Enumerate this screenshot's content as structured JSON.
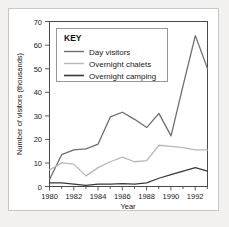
{
  "chart_data": {
    "type": "line",
    "title": "",
    "xlabel": "Year",
    "ylabel": "Number of visitors (thousands)",
    "x": [
      1980,
      1981,
      1982,
      1983,
      1984,
      1985,
      1986,
      1987,
      1988,
      1989,
      1990,
      1991,
      1992,
      1993
    ],
    "xlim": [
      1980,
      1993
    ],
    "ylim": [
      0,
      70
    ],
    "yticks": [
      0,
      10,
      20,
      30,
      40,
      50,
      60,
      70
    ],
    "xticks": [
      1980,
      1982,
      1984,
      1986,
      1988,
      1990,
      1992
    ],
    "xtick_labels": [
      "1980",
      "1982",
      "1984",
      "1986",
      "1988",
      "1990",
      "1992"
    ],
    "ytick_labels": [
      "0",
      "10",
      "20",
      "30",
      "40",
      "50",
      "60",
      "70"
    ],
    "grid": false,
    "legend_position": "top-left",
    "legend_title": "KEY",
    "series": [
      {
        "name": "Day visitors",
        "color": "#6e6e6e",
        "values": [
          3,
          13.5,
          15.5,
          16,
          18,
          29.5,
          31.5,
          28.5,
          25,
          31,
          21.5,
          43,
          64,
          50
        ]
      },
      {
        "name": "Overnight chalets",
        "color": "#b8b8b8",
        "values": [
          7,
          10,
          9.5,
          4.5,
          8,
          10.5,
          12.5,
          10.5,
          11,
          17.5,
          17,
          16.5,
          15.5,
          15.5
        ]
      },
      {
        "name": "Overnight camping",
        "color": "#3a3a3a",
        "values": [
          1.5,
          1.5,
          1,
          0.5,
          1,
          1,
          1.2,
          1,
          1.5,
          3.5,
          5,
          6.5,
          8,
          6.5
        ]
      }
    ]
  },
  "legend": {
    "title": "KEY",
    "items": [
      {
        "label": "Day visitors"
      },
      {
        "label": "Overnight chalets"
      },
      {
        "label": "Overnight camping"
      }
    ]
  },
  "axes": {
    "x_title": "Year",
    "y_title": "Number of visitors (thousands)"
  }
}
